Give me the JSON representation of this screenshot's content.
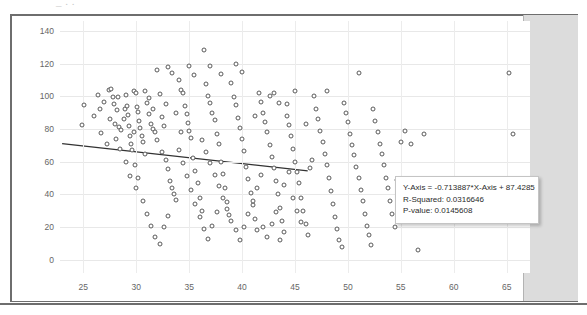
{
  "window": {
    "top_artifact_text": "_ .  .",
    "side_band_color": "#dcdcdc",
    "frame_color": "#6e6e6e"
  },
  "annotation": {
    "equation": "Y-Axis = -0.713887*X-Axis + 87.4285",
    "r_squared": "R-Squared: 0.0316646",
    "p_value": "P-value: 0.0145608"
  },
  "chart_data": {
    "type": "scatter",
    "title": "",
    "xlabel": "",
    "ylabel": "",
    "xlim": [
      22.8,
      67.2
    ],
    "ylim": [
      -8,
      146
    ],
    "grid": true,
    "legend": null,
    "xticks": [
      25,
      30,
      35,
      40,
      45,
      50,
      55,
      60,
      65
    ],
    "yticks": [
      0,
      20,
      40,
      60,
      80,
      100,
      120,
      140
    ],
    "marker": {
      "shape": "circle-open",
      "size": 5,
      "color": "#5a5a5a",
      "fill": "#ffffff"
    },
    "trendline": {
      "type": "linear",
      "slope": -0.713887,
      "intercept": 87.4285,
      "r_squared": 0.0316646,
      "p_value": 0.0145608,
      "color": "#333333",
      "x_start": 23.0,
      "x_end": 46.2,
      "equation_text": "Y-Axis = -0.713887*X-Axis + 87.4285"
    },
    "n_points": 228,
    "points": [
      [
        25.1,
        94.4
      ],
      [
        24.9,
        82.6
      ],
      [
        26.4,
        100.5
      ],
      [
        27.0,
        96.8
      ],
      [
        27.4,
        103.8
      ],
      [
        27.6,
        104.2
      ],
      [
        27.8,
        99.4
      ],
      [
        27.9,
        95.3
      ],
      [
        28.2,
        91.6
      ],
      [
        28.3,
        99.8
      ],
      [
        26.7,
        77.6
      ],
      [
        27.2,
        70.8
      ],
      [
        28.0,
        83.0
      ],
      [
        28.4,
        81.2
      ],
      [
        28.6,
        79.4
      ],
      [
        28.8,
        86.0
      ],
      [
        28.9,
        92.4
      ],
      [
        29.0,
        101.0
      ],
      [
        29.1,
        94.0
      ],
      [
        29.2,
        88.5
      ],
      [
        29.3,
        82.0
      ],
      [
        29.4,
        75.6
      ],
      [
        29.5,
        71.0
      ],
      [
        29.6,
        67.0
      ],
      [
        29.8,
        103.4
      ],
      [
        30.0,
        101.8
      ],
      [
        30.1,
        93.6
      ],
      [
        30.2,
        90.2
      ],
      [
        30.3,
        84.8
      ],
      [
        30.4,
        80.4
      ],
      [
        30.5,
        76.0
      ],
      [
        30.6,
        72.2
      ],
      [
        30.8,
        64.5
      ],
      [
        29.9,
        57.8
      ],
      [
        30.2,
        50.2
      ],
      [
        31.0,
        96.0
      ],
      [
        31.2,
        89.2
      ],
      [
        31.4,
        83.0
      ],
      [
        31.6,
        80.0
      ],
      [
        31.8,
        78.4
      ],
      [
        32.0,
        116.0
      ],
      [
        32.2,
        101.4
      ],
      [
        32.4,
        87.6
      ],
      [
        32.6,
        82.0
      ],
      [
        32.8,
        61.0
      ],
      [
        33.0,
        55.4
      ],
      [
        33.2,
        48.0
      ],
      [
        33.4,
        44.0
      ],
      [
        33.6,
        40.2
      ],
      [
        33.8,
        36.6
      ],
      [
        33.0,
        118.0
      ],
      [
        33.4,
        114.0
      ],
      [
        34.0,
        110.2
      ],
      [
        34.2,
        103.6
      ],
      [
        34.4,
        102.0
      ],
      [
        34.6,
        94.0
      ],
      [
        34.8,
        89.0
      ],
      [
        34.9,
        83.4
      ],
      [
        35.0,
        79.0
      ],
      [
        35.2,
        74.8
      ],
      [
        35.4,
        62.0
      ],
      [
        35.6,
        54.2
      ],
      [
        35.8,
        47.0
      ],
      [
        36.0,
        38.0
      ],
      [
        36.2,
        30.0
      ],
      [
        35.0,
        118.6
      ],
      [
        35.5,
        113.0
      ],
      [
        36.4,
        128.0
      ],
      [
        36.6,
        107.8
      ],
      [
        36.8,
        100.2
      ],
      [
        37.0,
        95.6
      ],
      [
        37.2,
        90.0
      ],
      [
        37.4,
        85.4
      ],
      [
        37.6,
        77.0
      ],
      [
        37.8,
        71.0
      ],
      [
        38.0,
        60.0
      ],
      [
        38.2,
        52.6
      ],
      [
        38.4,
        44.0
      ],
      [
        38.6,
        35.2
      ],
      [
        38.8,
        27.4
      ],
      [
        37.0,
        118.2
      ],
      [
        38.0,
        113.8
      ],
      [
        39.0,
        108.0
      ],
      [
        39.2,
        99.4
      ],
      [
        39.4,
        94.6
      ],
      [
        39.6,
        87.0
      ],
      [
        39.8,
        80.6
      ],
      [
        40.0,
        74.0
      ],
      [
        40.2,
        66.4
      ],
      [
        40.4,
        57.0
      ],
      [
        40.6,
        49.2
      ],
      [
        40.8,
        41.0
      ],
      [
        41.0,
        33.4
      ],
      [
        41.2,
        25.0
      ],
      [
        41.4,
        18.0
      ],
      [
        39.4,
        120.0
      ],
      [
        40.0,
        114.6
      ],
      [
        41.6,
        101.8
      ],
      [
        41.8,
        96.2
      ],
      [
        42.0,
        90.0
      ],
      [
        42.2,
        84.0
      ],
      [
        42.4,
        78.2
      ],
      [
        42.6,
        70.0
      ],
      [
        42.8,
        63.0
      ],
      [
        43.0,
        56.0
      ],
      [
        43.2,
        48.0
      ],
      [
        43.4,
        40.4
      ],
      [
        43.6,
        32.0
      ],
      [
        43.8,
        24.0
      ],
      [
        44.0,
        17.2
      ],
      [
        43.0,
        102.0
      ],
      [
        43.5,
        96.0
      ],
      [
        44.2,
        88.0
      ],
      [
        44.4,
        82.4
      ],
      [
        44.6,
        76.0
      ],
      [
        44.8,
        68.0
      ],
      [
        45.0,
        60.0
      ],
      [
        45.2,
        54.0
      ],
      [
        45.4,
        47.0
      ],
      [
        45.6,
        38.0
      ],
      [
        45.8,
        30.0
      ],
      [
        46.0,
        22.0
      ],
      [
        46.2,
        15.0
      ],
      [
        46.4,
        56.0
      ],
      [
        46.6,
        61.0
      ],
      [
        45.0,
        103.0
      ],
      [
        46.8,
        100.0
      ],
      [
        47.0,
        92.0
      ],
      [
        47.2,
        86.0
      ],
      [
        47.4,
        79.0
      ],
      [
        47.6,
        72.0
      ],
      [
        47.8,
        65.0
      ],
      [
        48.0,
        58.0
      ],
      [
        48.2,
        50.0
      ],
      [
        48.4,
        42.0
      ],
      [
        48.6,
        34.0
      ],
      [
        48.8,
        26.0
      ],
      [
        49.0,
        19.0
      ],
      [
        49.2,
        12.0
      ],
      [
        49.4,
        8.0
      ],
      [
        48.0,
        103.0
      ],
      [
        49.6,
        96.0
      ],
      [
        49.8,
        90.0
      ],
      [
        50.0,
        84.0
      ],
      [
        50.2,
        77.0
      ],
      [
        50.4,
        70.0
      ],
      [
        50.6,
        64.0
      ],
      [
        50.8,
        57.0
      ],
      [
        51.0,
        50.0
      ],
      [
        51.2,
        43.0
      ],
      [
        51.4,
        36.0
      ],
      [
        51.6,
        28.0
      ],
      [
        51.8,
        21.0
      ],
      [
        52.0,
        15.0
      ],
      [
        52.2,
        9.0
      ],
      [
        51.0,
        114.0
      ],
      [
        52.4,
        92.0
      ],
      [
        52.6,
        85.0
      ],
      [
        52.8,
        78.0
      ],
      [
        53.0,
        71.0
      ],
      [
        53.2,
        65.0
      ],
      [
        53.4,
        58.0
      ],
      [
        53.6,
        50.0
      ],
      [
        53.8,
        44.0
      ],
      [
        54.0,
        36.0
      ],
      [
        54.2,
        28.0
      ],
      [
        54.4,
        20.0
      ],
      [
        54.6,
        49.0
      ],
      [
        55.0,
        72.0
      ],
      [
        55.4,
        79.0
      ],
      [
        56.0,
        71.0
      ],
      [
        56.6,
        6.0
      ],
      [
        57.2,
        77.0
      ],
      [
        65.2,
        114.0
      ],
      [
        65.6,
        77.0
      ],
      [
        26.0,
        88.0
      ],
      [
        26.6,
        92.0
      ],
      [
        27.5,
        86.4
      ],
      [
        28.1,
        74.0
      ],
      [
        28.5,
        68.0
      ],
      [
        29.0,
        60.0
      ],
      [
        29.4,
        51.0
      ],
      [
        30.0,
        44.0
      ],
      [
        30.6,
        36.0
      ],
      [
        31.0,
        28.0
      ],
      [
        31.4,
        21.0
      ],
      [
        31.8,
        14.0
      ],
      [
        32.2,
        10.0
      ],
      [
        32.6,
        20.0
      ],
      [
        33.0,
        27.0
      ],
      [
        30.8,
        103.0
      ],
      [
        31.2,
        99.0
      ],
      [
        31.6,
        92.0
      ],
      [
        32.0,
        73.0
      ],
      [
        32.4,
        66.0
      ],
      [
        34.0,
        67.0
      ],
      [
        34.4,
        59.0
      ],
      [
        34.8,
        51.0
      ],
      [
        35.2,
        43.0
      ],
      [
        35.6,
        34.0
      ],
      [
        36.0,
        26.0
      ],
      [
        36.4,
        19.0
      ],
      [
        36.8,
        13.0
      ],
      [
        37.2,
        21.0
      ],
      [
        37.6,
        29.0
      ],
      [
        36.2,
        73.0
      ],
      [
        36.6,
        66.0
      ],
      [
        37.0,
        59.0
      ],
      [
        37.4,
        52.0
      ],
      [
        37.8,
        45.0
      ],
      [
        38.2,
        38.0
      ],
      [
        38.6,
        31.0
      ],
      [
        39.0,
        24.0
      ],
      [
        39.4,
        18.0
      ],
      [
        39.8,
        12.0
      ],
      [
        40.2,
        20.0
      ],
      [
        40.6,
        28.0
      ],
      [
        41.0,
        36.0
      ],
      [
        41.4,
        44.0
      ],
      [
        41.8,
        52.0
      ],
      [
        42.0,
        20.0
      ],
      [
        42.4,
        14.0
      ],
      [
        42.8,
        22.0
      ],
      [
        43.2,
        29.0
      ],
      [
        43.6,
        12.0
      ],
      [
        44.0,
        46.0
      ],
      [
        44.4,
        54.0
      ],
      [
        44.8,
        38.0
      ],
      [
        45.2,
        30.0
      ],
      [
        45.6,
        23.0
      ],
      [
        41.2,
        88.0
      ],
      [
        42.6,
        100.0
      ],
      [
        44.2,
        95.0
      ],
      [
        46.0,
        83.0
      ],
      [
        33.8,
        90.0
      ],
      [
        34.2,
        78.0
      ],
      [
        32.8,
        95.0
      ],
      [
        29.8,
        78.0
      ]
    ]
  }
}
